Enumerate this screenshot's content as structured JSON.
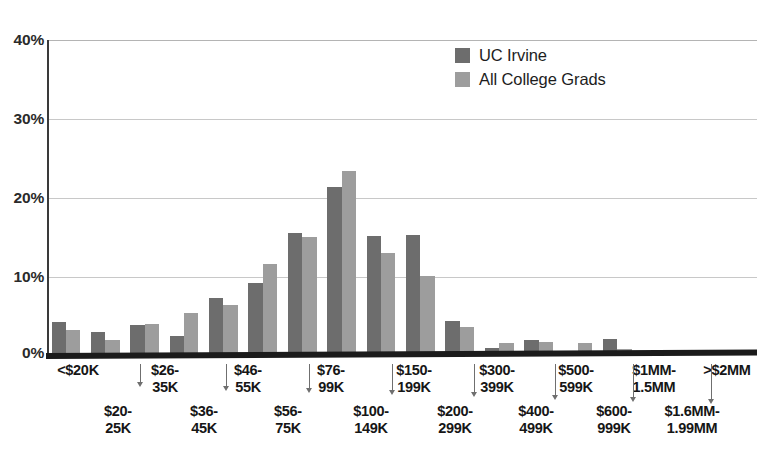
{
  "legend": {
    "position": "top-center-right",
    "items": [
      {
        "label": "UC Irvine",
        "color": "#6d6d6d",
        "swatch": "legend-swatch-dark"
      },
      {
        "label": "All College Grads",
        "color": "#9d9d9d",
        "swatch": "legend-swatch-light"
      }
    ]
  },
  "axis": {
    "y_ticks": [
      "40%",
      "30%",
      "20%",
      "10%",
      "0%"
    ]
  },
  "chart_data": {
    "type": "bar",
    "title": "",
    "subtitle": "",
    "xlabel": "",
    "ylabel": "",
    "ylim": [
      0,
      40
    ],
    "yticks": [
      0,
      10,
      20,
      30,
      40
    ],
    "ytick_labels": [
      "0%",
      "10%",
      "20%",
      "30%",
      "40%"
    ],
    "grid": true,
    "grid_axis": "y",
    "legend_position": "upper right",
    "categories": [
      "<$20K",
      "$20-25K",
      "$26-35K",
      "$36-45K",
      "$46-55K",
      "$56-75K",
      "$76-99K",
      "$100-149K",
      "$150-199K",
      "$200-299K",
      "$300-399K",
      "$400-499K",
      "$500-599K",
      "$600-999K",
      "$1MM-1.5MM",
      "$1.6MM-1.99MM",
      ">$2MM",
      ""
    ],
    "series": [
      {
        "name": "UC Irvine",
        "color": "#6d6d6d",
        "values": [
          4.2,
          2.9,
          3.8,
          2.4,
          7.3,
          9.2,
          15.5,
          21.3,
          15.1,
          15.2,
          4.3,
          0.9,
          1.9,
          0.2,
          2.0,
          0.3,
          0.5,
          0.4
        ]
      },
      {
        "name": "All College Grads",
        "color": "#9d9d9d",
        "values": [
          3.2,
          1.9,
          4.0,
          5.3,
          6.3,
          11.6,
          15.0,
          23.4,
          12.9,
          10.0,
          3.6,
          1.5,
          1.6,
          1.5,
          0.8,
          0.4,
          0.6,
          0.7
        ]
      }
    ]
  },
  "x_axis_labels": {
    "top_row": [
      "<$20K",
      "$26-\n35K",
      "$46-\n55K",
      "$76-\n99K",
      "$150-\n199K",
      "$300-\n399K",
      "$500-\n599K",
      "$1MM-\n1.5MM",
      ">$2MM"
    ],
    "bottom_row": [
      "$20-\n25K",
      "$36-\n45K",
      "$56-\n75K",
      "$100-\n149K",
      "$200-\n299K",
      "$400-\n499K",
      "$600-\n999K",
      "$1.6MM-\n1.99MM"
    ]
  }
}
